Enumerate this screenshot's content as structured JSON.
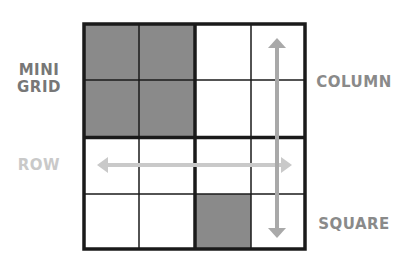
{
  "labels": {
    "mini_grid_line1": "MINI",
    "mini_grid_line2": "GRID",
    "row": "ROW",
    "column": "COLUMN",
    "square": "SQUARE"
  },
  "grid": {
    "size": 4,
    "mini_grid_size": 2,
    "shaded_cells": [
      [
        0,
        0
      ],
      [
        0,
        1
      ],
      [
        1,
        0
      ],
      [
        1,
        1
      ],
      [
        3,
        2
      ]
    ]
  },
  "colors": {
    "shaded_cell": "#8a8a8a",
    "grid_line": "#1a1a1a",
    "row_arrow": "#c9c9c9",
    "column_arrow": "#a9a9a9",
    "mini_grid_label": "#777777",
    "row_label": "#c9c9c9",
    "column_label": "#8a8a8a",
    "square_label": "#8a8a8a"
  }
}
